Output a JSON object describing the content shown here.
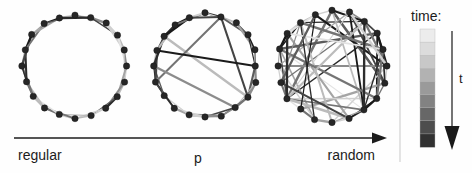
{
  "figure": {
    "caption_axis": {
      "left_label": "regular",
      "mid_label": "p",
      "right_label": "random"
    },
    "legend": {
      "title": "time:",
      "time_symbol": "t",
      "colorbar_shades": [
        "#ececec",
        "#dcdcdc",
        "#c8c8c8",
        "#b2b2b2",
        "#9a9a9a",
        "#828282",
        "#676767",
        "#4d4d4d",
        "#313131"
      ],
      "arrow_direction": "down"
    }
  },
  "chart_data": {
    "type": "diagram",
    "title": "",
    "xlabel": "p",
    "ylabel": "",
    "panels": [
      {
        "name": "regular",
        "label": "regular",
        "p": 0,
        "n_nodes": 20,
        "k": 2,
        "cx": 75,
        "cy": 66,
        "r": 52,
        "rewired_edges": 0
      },
      {
        "name": "small-world",
        "label": "p",
        "p": 0.1,
        "n_nodes": 20,
        "k": 2,
        "cx": 205,
        "cy": 66,
        "r": 52,
        "rewired_edges": 5
      },
      {
        "name": "random",
        "label": "random",
        "p": 1,
        "n_nodes": 20,
        "k": 2,
        "cx": 332,
        "cy": 66,
        "r": 55,
        "rewired_edges": 40
      }
    ],
    "edge_shades": [
      "#e2e2e2",
      "#d0d0d0",
      "#bbbbbb",
      "#a4a4a4",
      "#8c8c8c",
      "#747474",
      "#5c5c5c",
      "#444444",
      "#2c2c2c",
      "#1a1a1a"
    ],
    "legend_position": "right",
    "grid": false
  }
}
